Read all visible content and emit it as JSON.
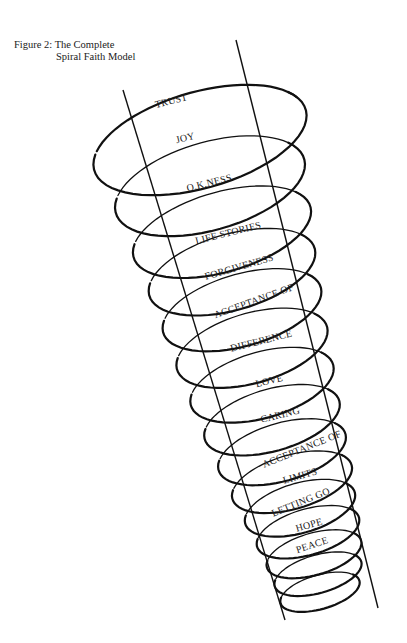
{
  "caption": {
    "line1": "Figure 2: The Complete",
    "line2": "Spiral Faith Model"
  },
  "diagram": {
    "type": "spiral",
    "title": "The Complete Spiral Faith Model",
    "stages": [
      {
        "label": "TRUST",
        "x": 172,
        "y": 104,
        "rot": -14
      },
      {
        "label": "JOY",
        "x": 186,
        "y": 141,
        "rot": -14
      },
      {
        "label": "O.K.NESS",
        "x": 210,
        "y": 186,
        "rot": -14
      },
      {
        "label": "LIFE STORIES",
        "x": 229,
        "y": 236,
        "rot": -14
      },
      {
        "label": "FORGIVENESS",
        "x": 240,
        "y": 270,
        "rot": -16
      },
      {
        "label": "ACCEPTANCE OF",
        "x": 255,
        "y": 304,
        "rot": -20
      },
      {
        "label": "DIFFERENCE",
        "x": 262,
        "y": 344,
        "rot": -14
      },
      {
        "label": "LOVE",
        "x": 270,
        "y": 384,
        "rot": -14
      },
      {
        "label": "CARING",
        "x": 281,
        "y": 418,
        "rot": -14
      },
      {
        "label": "ACCEPTANCE OF",
        "x": 303,
        "y": 452,
        "rot": -22
      },
      {
        "label": "LIMITS",
        "x": 301,
        "y": 479,
        "rot": -16
      },
      {
        "label": "LETTING GO",
        "x": 302,
        "y": 505,
        "rot": -22
      },
      {
        "label": "HOPE",
        "x": 310,
        "y": 528,
        "rot": -16
      },
      {
        "label": "PEACE",
        "x": 313,
        "y": 548,
        "rot": -18
      }
    ]
  }
}
